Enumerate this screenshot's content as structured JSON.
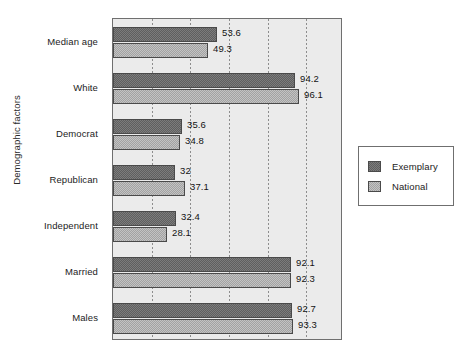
{
  "chart_data": {
    "type": "bar",
    "orientation": "horizontal",
    "title": "",
    "xlabel": "",
    "ylabel": "Demographic factors",
    "categories": [
      "Median age",
      "White",
      "Democrat",
      "Republican",
      "Independent",
      "Married",
      "Males"
    ],
    "series": [
      {
        "name": "Exemplary",
        "color": "#7c7c7c",
        "values": [
          53.6,
          94.2,
          35.6,
          32,
          32.4,
          92.1,
          92.7
        ],
        "labels": [
          "53.6",
          "94.2",
          "35.6",
          "32",
          "32.4",
          "92.1",
          "92.7"
        ]
      },
      {
        "name": "National",
        "color": "#c3c3c3",
        "values": [
          49.3,
          96.1,
          34.8,
          37.1,
          28.1,
          92.3,
          93.3
        ],
        "labels": [
          "49.3",
          "96.1",
          "34.8",
          "37.1",
          "28.1",
          "92.3",
          "93.3"
        ]
      }
    ],
    "xlim": [
      0,
      118
    ],
    "x_gridline_values": [
      20,
      40,
      60,
      80,
      100
    ],
    "x_tick_labels_visible": false,
    "grid": true,
    "legend_position": "right",
    "legend_entries": [
      "Exemplary",
      "National"
    ]
  },
  "legend": {
    "items": [
      {
        "label": "Exemplary"
      },
      {
        "label": "National"
      }
    ]
  },
  "axis": {
    "y_title": "Demographic factors"
  }
}
